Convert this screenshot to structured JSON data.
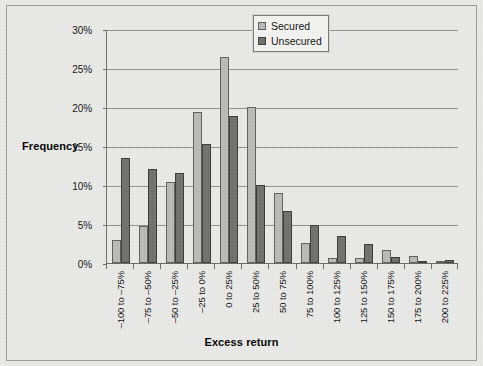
{
  "chart_data": {
    "type": "bar",
    "title": "",
    "subtitle": "",
    "xlabel": "Excess return",
    "ylabel": "Frequency",
    "ylim": [
      0,
      30
    ],
    "ytick_labels": [
      "0%",
      "5%",
      "10%",
      "15%",
      "20%",
      "25%",
      "30%"
    ],
    "ytick_values": [
      0,
      5,
      10,
      15,
      20,
      25,
      30
    ],
    "grid": true,
    "legend_position": "top-right-inside",
    "categories": [
      "-100 to -75%",
      "-75 to -50%",
      "-50 to -25%",
      "-25 to 0%",
      "0 to 25%",
      "25 to 50%",
      "50 to 75%",
      "75 to 100%",
      "100 to 125%",
      "125 to 150%",
      "150 to 175%",
      "175 to 200%",
      "200 to 225%"
    ],
    "series": [
      {
        "name": "Secured",
        "color": "#b9b9b5",
        "values": [
          3.0,
          4.7,
          10.4,
          19.4,
          26.4,
          20.0,
          9.0,
          2.6,
          0.6,
          0.6,
          1.7,
          0.9,
          0.2
        ]
      },
      {
        "name": "Unsecured",
        "color": "#6f6f6c",
        "values": [
          13.5,
          12.0,
          11.6,
          15.2,
          18.9,
          10.0,
          6.7,
          4.9,
          3.4,
          2.4,
          0.8,
          0.2,
          0.4
        ]
      }
    ]
  },
  "legend": {
    "items": [
      {
        "label": "Secured"
      },
      {
        "label": "Unsecured"
      }
    ]
  },
  "axes": {
    "y_title": "Frequency",
    "x_title": "Excess return"
  },
  "colors": {
    "background": "#e9e9e7",
    "frame": "#9a9a96",
    "axis": "#6b6b68",
    "gridline": "#8f8f8c",
    "secured": "#b9b9b5",
    "unsecured": "#6f6f6c"
  }
}
